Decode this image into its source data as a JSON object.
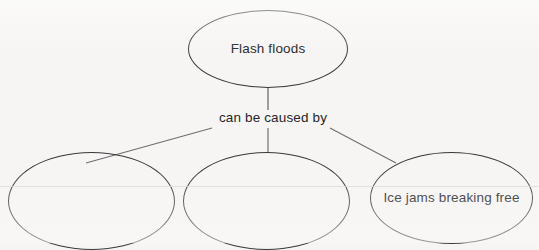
{
  "diagram": {
    "type": "concept-map",
    "background_color": "#f6f5f3",
    "stroke_color": "#3a3a3c",
    "text_color": "#26262a",
    "nodes": [
      {
        "id": "flash-floods",
        "label": "Flash floods",
        "shape": "ellipse",
        "role": "root"
      },
      {
        "id": "blank-left",
        "label": "",
        "shape": "ellipse",
        "role": "cause"
      },
      {
        "id": "blank-middle",
        "label": "",
        "shape": "ellipse",
        "role": "cause"
      },
      {
        "id": "ice-jams",
        "label": "Ice jams breaking free",
        "shape": "ellipse",
        "role": "cause"
      }
    ],
    "link_labels": [
      {
        "id": "caused-by",
        "text": "can be caused by"
      }
    ],
    "edges": [
      {
        "from": "flash-floods",
        "to": "caused-by"
      },
      {
        "from": "caused-by",
        "to": "blank-left"
      },
      {
        "from": "caused-by",
        "to": "blank-middle"
      },
      {
        "from": "caused-by",
        "to": "ice-jams"
      }
    ]
  }
}
